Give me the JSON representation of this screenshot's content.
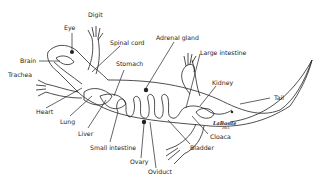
{
  "diagram": {
    "labels": {
      "digit": "Digit",
      "eye": "Eye",
      "spinal_cord": "Spinal cord",
      "adrenal_gland": "Adrenal gland",
      "large_intestine": "Large intestine",
      "brain": "Brain",
      "trachea": "Trachea",
      "stomach": "Stomach",
      "kidney": "Kidney",
      "tail": "Tail",
      "heart": "Heart",
      "lung": "Lung",
      "liver": "Liver",
      "small_intestine": "Small intestine",
      "ovary": "Ovary",
      "oviduct": "Oviduct",
      "bladder": "Bladder",
      "cloaca": "Cloaca"
    },
    "signature": {
      "name": "LaBonte",
      "year": "2011"
    }
  }
}
